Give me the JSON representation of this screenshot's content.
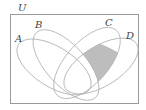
{
  "diagram": {
    "type": "venn",
    "universe_label": "U",
    "sets": [
      {
        "id": "A",
        "label": "A"
      },
      {
        "id": "B",
        "label": "B"
      },
      {
        "id": "C",
        "label": "C"
      },
      {
        "id": "D",
        "label": "D"
      }
    ],
    "shaded_region": "C ∩ D (outside A and B)",
    "colors": {
      "outline": "#b0b0b0",
      "border": "#999999",
      "shade": "#bdbdbd",
      "text": "#444444"
    }
  }
}
